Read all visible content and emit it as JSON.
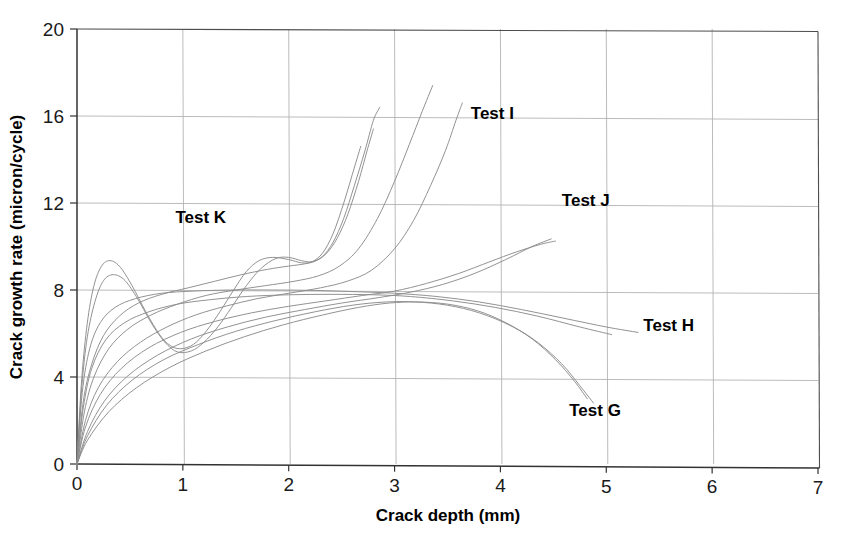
{
  "chart_data": {
    "type": "line",
    "title": "",
    "xlabel": "Crack depth (mm)",
    "ylabel": "Crack growth rate (micron/cycle)",
    "xlim": [
      0,
      7
    ],
    "ylim": [
      0,
      20
    ],
    "xticks": [
      "0",
      "1",
      "2",
      "3",
      "4",
      "5",
      "6",
      "7"
    ],
    "yticks": [
      "0",
      "4",
      "8",
      "12",
      "16",
      "20"
    ],
    "xtick_values": [
      0,
      1,
      2,
      3,
      4,
      5,
      6,
      7
    ],
    "ytick_values": [
      0,
      4,
      8,
      12,
      16,
      20
    ],
    "grid": true,
    "legend_position": "inline-annotations",
    "line_color": "#8c8c8c",
    "axis_color": "#4d4d4d",
    "grid_color": "#b3b3b3",
    "annotations": [
      {
        "text": "Test K",
        "x": 0.93,
        "y": 11.1
      },
      {
        "text": "Test I",
        "x": 3.72,
        "y": 15.85
      },
      {
        "text": "Test J",
        "x": 4.58,
        "y": 11.85
      },
      {
        "text": "Test H",
        "x": 5.35,
        "y": 6.1
      },
      {
        "text": "Test G",
        "x": 4.65,
        "y": 2.2
      }
    ],
    "series": [
      {
        "name": "Test K-1",
        "label": "Test K",
        "points": [
          [
            0.0,
            0.0
          ],
          [
            0.04,
            3.6
          ],
          [
            0.09,
            6.2
          ],
          [
            0.15,
            8.0
          ],
          [
            0.22,
            9.0
          ],
          [
            0.3,
            9.35
          ],
          [
            0.4,
            9.1
          ],
          [
            0.52,
            8.2
          ],
          [
            0.65,
            7.0
          ],
          [
            0.78,
            5.95
          ],
          [
            0.88,
            5.45
          ],
          [
            0.98,
            5.3
          ],
          [
            1.1,
            5.5
          ],
          [
            1.22,
            6.1
          ],
          [
            1.35,
            7.0
          ],
          [
            1.48,
            8.0
          ],
          [
            1.6,
            8.85
          ],
          [
            1.72,
            9.35
          ],
          [
            1.85,
            9.5
          ],
          [
            2.0,
            9.4
          ],
          [
            2.12,
            9.25
          ],
          [
            2.22,
            9.3
          ],
          [
            2.32,
            9.7
          ],
          [
            2.42,
            10.6
          ],
          [
            2.52,
            12.0
          ],
          [
            2.6,
            13.3
          ],
          [
            2.68,
            14.6
          ]
        ]
      },
      {
        "name": "Test K-2",
        "label": "Test K",
        "points": [
          [
            0.0,
            0.0
          ],
          [
            0.04,
            3.2
          ],
          [
            0.09,
            5.6
          ],
          [
            0.16,
            7.3
          ],
          [
            0.24,
            8.35
          ],
          [
            0.33,
            8.7
          ],
          [
            0.44,
            8.5
          ],
          [
            0.56,
            7.7
          ],
          [
            0.7,
            6.5
          ],
          [
            0.83,
            5.6
          ],
          [
            0.95,
            5.15
          ],
          [
            1.08,
            5.2
          ],
          [
            1.2,
            5.6
          ],
          [
            1.33,
            6.3
          ],
          [
            1.46,
            7.2
          ],
          [
            1.6,
            8.2
          ],
          [
            1.74,
            9.0
          ],
          [
            1.88,
            9.45
          ],
          [
            2.0,
            9.5
          ],
          [
            2.12,
            9.35
          ],
          [
            2.22,
            9.3
          ],
          [
            2.32,
            9.55
          ],
          [
            2.42,
            10.2
          ],
          [
            2.52,
            11.3
          ],
          [
            2.62,
            12.8
          ],
          [
            2.72,
            14.4
          ],
          [
            2.8,
            15.8
          ],
          [
            2.86,
            16.4
          ]
        ]
      },
      {
        "name": "Test I-1",
        "label": "Test I",
        "points": [
          [
            0.0,
            0.0
          ],
          [
            0.06,
            2.9
          ],
          [
            0.14,
            4.6
          ],
          [
            0.25,
            5.9
          ],
          [
            0.4,
            6.8
          ],
          [
            0.58,
            7.4
          ],
          [
            0.8,
            7.8
          ],
          [
            1.05,
            8.1
          ],
          [
            1.3,
            8.4
          ],
          [
            1.55,
            8.7
          ],
          [
            1.8,
            8.95
          ],
          [
            2.0,
            9.1
          ],
          [
            2.15,
            9.2
          ],
          [
            2.26,
            9.35
          ],
          [
            2.36,
            9.7
          ],
          [
            2.46,
            10.4
          ],
          [
            2.56,
            11.5
          ],
          [
            2.66,
            13.0
          ],
          [
            2.74,
            14.4
          ],
          [
            2.8,
            15.4
          ]
        ]
      },
      {
        "name": "Test I-2",
        "label": "Test I",
        "points": [
          [
            0.0,
            0.0
          ],
          [
            0.07,
            2.4
          ],
          [
            0.16,
            4.0
          ],
          [
            0.3,
            5.3
          ],
          [
            0.48,
            6.2
          ],
          [
            0.7,
            6.85
          ],
          [
            0.95,
            7.35
          ],
          [
            1.22,
            7.75
          ],
          [
            1.5,
            8.0
          ],
          [
            1.78,
            8.2
          ],
          [
            2.05,
            8.4
          ],
          [
            2.28,
            8.65
          ],
          [
            2.48,
            9.1
          ],
          [
            2.66,
            9.9
          ],
          [
            2.84,
            11.3
          ],
          [
            3.0,
            13.0
          ],
          [
            3.14,
            14.7
          ],
          [
            3.26,
            16.2
          ],
          [
            3.36,
            17.4
          ]
        ]
      },
      {
        "name": "Test I-3",
        "label": "Test I",
        "points": [
          [
            0.0,
            0.0
          ],
          [
            0.08,
            2.0
          ],
          [
            0.2,
            3.5
          ],
          [
            0.38,
            4.7
          ],
          [
            0.6,
            5.6
          ],
          [
            0.85,
            6.3
          ],
          [
            1.12,
            6.85
          ],
          [
            1.4,
            7.25
          ],
          [
            1.7,
            7.6
          ],
          [
            2.0,
            7.85
          ],
          [
            2.3,
            8.1
          ],
          [
            2.55,
            8.4
          ],
          [
            2.78,
            8.9
          ],
          [
            3.0,
            9.9
          ],
          [
            3.18,
            11.2
          ],
          [
            3.34,
            12.8
          ],
          [
            3.48,
            14.4
          ],
          [
            3.58,
            15.8
          ],
          [
            3.64,
            16.6
          ]
        ]
      },
      {
        "name": "Test J-1",
        "label": "Test J",
        "points": [
          [
            0.0,
            0.0
          ],
          [
            0.08,
            1.7
          ],
          [
            0.22,
            3.2
          ],
          [
            0.42,
            4.4
          ],
          [
            0.68,
            5.35
          ],
          [
            0.98,
            6.05
          ],
          [
            1.3,
            6.55
          ],
          [
            1.65,
            6.95
          ],
          [
            2.0,
            7.25
          ],
          [
            2.35,
            7.5
          ],
          [
            2.7,
            7.75
          ],
          [
            3.0,
            7.95
          ],
          [
            3.3,
            8.3
          ],
          [
            3.6,
            8.75
          ],
          [
            3.9,
            9.3
          ],
          [
            4.15,
            9.75
          ],
          [
            4.38,
            10.1
          ],
          [
            4.52,
            10.25
          ]
        ]
      },
      {
        "name": "Test J-2",
        "label": "Test J",
        "points": [
          [
            0.0,
            0.0
          ],
          [
            0.1,
            1.5
          ],
          [
            0.26,
            2.9
          ],
          [
            0.48,
            4.05
          ],
          [
            0.76,
            5.0
          ],
          [
            1.08,
            5.75
          ],
          [
            1.42,
            6.3
          ],
          [
            1.78,
            6.75
          ],
          [
            2.15,
            7.1
          ],
          [
            2.5,
            7.4
          ],
          [
            2.85,
            7.65
          ],
          [
            3.15,
            7.9
          ],
          [
            3.45,
            8.25
          ],
          [
            3.75,
            8.75
          ],
          [
            4.05,
            9.4
          ],
          [
            4.3,
            10.0
          ],
          [
            4.48,
            10.35
          ]
        ]
      },
      {
        "name": "Test H-1",
        "label": "Test H",
        "points": [
          [
            0.0,
            0.0
          ],
          [
            0.05,
            3.3
          ],
          [
            0.12,
            5.3
          ],
          [
            0.22,
            6.5
          ],
          [
            0.36,
            7.2
          ],
          [
            0.55,
            7.6
          ],
          [
            0.8,
            7.85
          ],
          [
            1.1,
            7.95
          ],
          [
            1.45,
            8.0
          ],
          [
            1.85,
            8.0
          ],
          [
            2.25,
            7.98
          ],
          [
            2.65,
            7.92
          ],
          [
            3.0,
            7.85
          ],
          [
            3.4,
            7.7
          ],
          [
            3.8,
            7.45
          ],
          [
            4.2,
            7.1
          ],
          [
            4.6,
            6.7
          ],
          [
            5.0,
            6.3
          ],
          [
            5.3,
            6.05
          ]
        ]
      },
      {
        "name": "Test H-2",
        "label": "Test H",
        "points": [
          [
            0.0,
            0.0
          ],
          [
            0.06,
            2.6
          ],
          [
            0.14,
            4.4
          ],
          [
            0.27,
            5.7
          ],
          [
            0.45,
            6.5
          ],
          [
            0.68,
            7.0
          ],
          [
            0.95,
            7.35
          ],
          [
            1.25,
            7.55
          ],
          [
            1.6,
            7.7
          ],
          [
            2.0,
            7.78
          ],
          [
            2.4,
            7.8
          ],
          [
            2.8,
            7.78
          ],
          [
            3.15,
            7.7
          ],
          [
            3.55,
            7.5
          ],
          [
            3.95,
            7.2
          ],
          [
            4.35,
            6.8
          ],
          [
            4.75,
            6.3
          ],
          [
            5.05,
            5.95
          ]
        ]
      },
      {
        "name": "Test G-1",
        "label": "Test G",
        "points": [
          [
            0.0,
            0.0
          ],
          [
            0.1,
            1.3
          ],
          [
            0.28,
            2.7
          ],
          [
            0.52,
            3.85
          ],
          [
            0.82,
            4.8
          ],
          [
            1.15,
            5.5
          ],
          [
            1.5,
            6.1
          ],
          [
            1.88,
            6.6
          ],
          [
            2.25,
            7.0
          ],
          [
            2.6,
            7.3
          ],
          [
            2.92,
            7.45
          ],
          [
            3.2,
            7.45
          ],
          [
            3.5,
            7.3
          ],
          [
            3.8,
            6.95
          ],
          [
            4.1,
            6.35
          ],
          [
            4.35,
            5.6
          ],
          [
            4.58,
            4.6
          ],
          [
            4.75,
            3.6
          ],
          [
            4.88,
            2.8
          ]
        ]
      },
      {
        "name": "Test G-2",
        "label": "Test G",
        "points": [
          [
            0.0,
            0.0
          ],
          [
            0.1,
            1.1
          ],
          [
            0.3,
            2.4
          ],
          [
            0.56,
            3.5
          ],
          [
            0.88,
            4.45
          ],
          [
            1.22,
            5.2
          ],
          [
            1.58,
            5.85
          ],
          [
            1.95,
            6.4
          ],
          [
            2.32,
            6.85
          ],
          [
            2.66,
            7.2
          ],
          [
            2.95,
            7.4
          ],
          [
            3.22,
            7.45
          ],
          [
            3.5,
            7.35
          ],
          [
            3.78,
            7.05
          ],
          [
            4.05,
            6.5
          ],
          [
            4.3,
            5.75
          ],
          [
            4.52,
            4.8
          ],
          [
            4.7,
            3.8
          ],
          [
            4.82,
            3.0
          ]
        ]
      }
    ]
  }
}
